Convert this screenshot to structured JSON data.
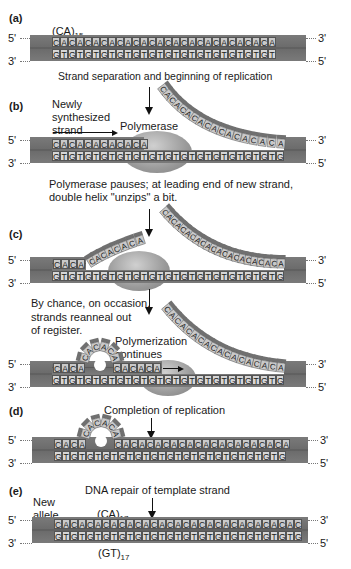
{
  "figure": {
    "end_labels": {
      "five_prime": "5'",
      "three_prime": "3'"
    },
    "colors": {
      "duplex_backbone": "#6c6c6c",
      "base_box": "#c9c9c9",
      "polymerase": "#9a9a9a",
      "text": "#1a1a1a"
    },
    "panels": [
      {
        "id": "a",
        "label": "(a)",
        "repeat_label": "(CA)",
        "repeat_count": "15",
        "top_strand": "CACACACACACACACACACACACACACACA",
        "bottom_strand": "GTGTGTGTGTGTGTGTGTGTGTGTGTGTGT",
        "caption_below": "Strand separation and beginning of replication"
      },
      {
        "id": "b",
        "label": "(b)",
        "new_strand_label": "Newly synthesized strand",
        "new_strand_lines": [
          "Newly",
          "synthesized",
          "strand"
        ],
        "polymerase_label": "Polymerase",
        "top_strand": "CACACACACACA",
        "displaced_strand": "CACACACACACACACACA",
        "bottom_strand": "GTGTGTGTGTGTGTGTGTGTGTGTGTGTGT",
        "caption_below_lines": [
          "Polymerase pauses; at leading end of new strand,",
          "double helix \"unzips\" a bit."
        ]
      },
      {
        "id": "c",
        "label": "(c)",
        "top_strand_paired": "CACA",
        "top_strand_lifted": "CACACACA",
        "displaced_strand": "CACACACACACACACACACACA",
        "bottom_strand": "GTGTGTGTGTGTGTGTGTGTGTGTGTGTGT",
        "caption_below_lines": [
          "By chance, on occasion,",
          "strands reanneal out",
          "of register."
        ],
        "slip_panel": {
          "paired_left": "CACA",
          "loop": "CACACA",
          "paired_right": "CACACA",
          "polymerization_label_lines": [
            "Polymerization",
            "continues"
          ],
          "displaced_strand": "CACACACACACACACACA",
          "bottom_strand": "GTGTGTGTGTGTGTGTGTGTGTGTGTGTGT"
        }
      },
      {
        "id": "d",
        "label": "(d)",
        "caption_above": "Completion of replication",
        "paired_left": "CACA",
        "loop": "CACACA",
        "top_strand_right": "CACACACACACACACACACACACA",
        "bottom_strand": "GTGTGTGTGTGTGTGTGTGTGTGTGTGTGT"
      },
      {
        "id": "e",
        "label": "(e)",
        "caption_above": "DNA repair of template strand",
        "allele_label_lines": [
          "New",
          "allele"
        ],
        "top_repeat_label": "(CA)",
        "top_repeat_count": "17",
        "bottom_repeat_label": "(GT)",
        "bottom_repeat_count": "17",
        "top_strand": "CACACACACACACACACACACACACACACACACA",
        "bottom_strand": "GTGTGTGTGTGTGTGTGTGTGTGTGTGTGTGTGT"
      }
    ]
  }
}
